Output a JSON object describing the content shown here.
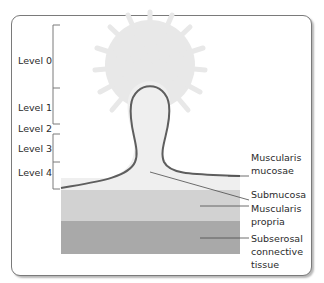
{
  "levels": [
    {
      "label": "Level 0"
    },
    {
      "label": "Level 1"
    },
    {
      "label": "Level 2"
    },
    {
      "label": "Level 3"
    },
    {
      "label": "Level 4"
    }
  ],
  "layers": [
    {
      "label_line1": "Muscularis",
      "label_line2": "mucosae",
      "color": "#5e5e5e"
    },
    {
      "label_line1": "Submucosa",
      "color": "#efefef"
    },
    {
      "label_line1": "Muscularis",
      "label_line2": "propria",
      "color": "#d2d2d2"
    },
    {
      "label_line1": "Subserosal",
      "label_line2": "connective",
      "label_line3": "tissue",
      "color": "#a9a9a9"
    }
  ],
  "colors": {
    "frame": "#7a7a7a",
    "polyp_outline": "#5e5e5e",
    "halo": "#e6e6e6",
    "leader": "#4a4a4a"
  }
}
